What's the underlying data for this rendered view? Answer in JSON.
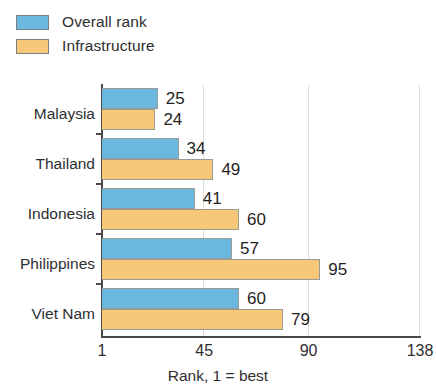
{
  "legend": {
    "items": [
      {
        "label": "Overall rank",
        "color": "#6cb7de",
        "icon": "legend-swatch-icon"
      },
      {
        "label": "Infrastructure",
        "color": "#f7c878",
        "icon": "legend-swatch-icon"
      }
    ]
  },
  "axis": {
    "caption": "Rank, 1 = best",
    "ticks": [
      "1",
      "45",
      "90",
      "138"
    ]
  },
  "chart_data": {
    "type": "bar",
    "orientation": "horizontal",
    "title": "",
    "subtitle": "",
    "xlabel": "Rank, 1 = best",
    "ylabel": "",
    "xlim": [
      1,
      138
    ],
    "xticks": [
      1,
      45,
      90,
      138
    ],
    "grid": true,
    "legend_position": "top-left",
    "categories": [
      "Malaysia",
      "Thailand",
      "Indonesia",
      "Philippines",
      "Viet Nam"
    ],
    "series": [
      {
        "name": "Overall rank",
        "color": "#6cb7de",
        "values": [
          25,
          34,
          41,
          57,
          60
        ]
      },
      {
        "name": "Infrastructure",
        "color": "#f7c878",
        "values": [
          24,
          49,
          60,
          95,
          79
        ]
      }
    ],
    "data_labels": {
      "Malaysia": {
        "Overall rank": "25",
        "Infrastructure": "24"
      },
      "Thailand": {
        "Overall rank": "34",
        "Infrastructure": "49"
      },
      "Indonesia": {
        "Overall rank": "41",
        "Infrastructure": "60"
      },
      "Philippines": {
        "Overall rank": "57",
        "Infrastructure": "95"
      },
      "Viet Nam": {
        "Overall rank": "60",
        "Infrastructure": "79"
      }
    }
  }
}
